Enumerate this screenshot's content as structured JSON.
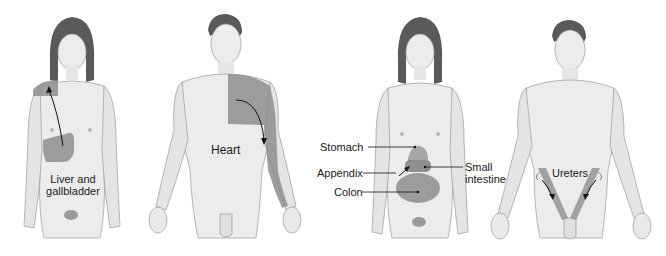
{
  "colors": {
    "skin": "#e9e9e9",
    "skin_shade": "#cfcfcf",
    "outline": "#9a9a9a",
    "hair": "#5a5a5a",
    "pain_area": "#8e8e8e",
    "text": "#1a1a1a"
  },
  "figures": [
    {
      "id": "liver-gallbladder",
      "sex": "female",
      "labels": [
        {
          "text": "Liver and gallbladder",
          "line1": "Liver and",
          "line2": "gallbladder"
        }
      ],
      "highlighted_regions": [
        "right upper abdomen",
        "right shoulder"
      ],
      "arrow": "from right upper abdomen up to right shoulder"
    },
    {
      "id": "heart",
      "sex": "male",
      "labels": [
        {
          "text": "Heart"
        }
      ],
      "highlighted_regions": [
        "left chest",
        "left shoulder",
        "left inner arm"
      ],
      "arrow": "from chest down left arm"
    },
    {
      "id": "digestive",
      "sex": "female",
      "labels": [
        {
          "text": "Stomach"
        },
        {
          "text": "Appendix"
        },
        {
          "text": "Colon"
        },
        {
          "text": "Small intestine",
          "line1": "Small",
          "line2": "intestine"
        }
      ],
      "highlighted_regions": [
        "epigastric",
        "periumbilical",
        "lower abdomen"
      ]
    },
    {
      "id": "ureters",
      "sex": "male",
      "labels": [
        {
          "text": "Ureters"
        }
      ],
      "highlighted_regions": [
        "left flank to groin",
        "right flank to groin"
      ],
      "arrow": "from flanks toward groin, both sides"
    }
  ]
}
